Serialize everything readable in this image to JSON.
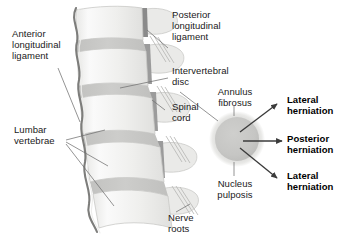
{
  "figure": {
    "background_color": "#ffffff",
    "text_color": "#1a1a1a",
    "bone_light": "#f2f2f0",
    "bone_mid": "#e2e2e0",
    "bone_shade": "#d2d2d0",
    "disc_band": "#c9c9c7",
    "ligament_dark": "#6e6e6e",
    "outline": "#8c8c8c",
    "annulus_color": "#dcdcda",
    "nucleus_color": "#c6c6c4",
    "arrow_color": "#3b3b3b",
    "leader_color": "#6f6f6f"
  },
  "labels": {
    "anterior_longitudinal_ligament": "Anterior\nlongitudinal\nligament",
    "lumbar_vertebrae": "Lumbar\nvertebrae",
    "posterior_longitudinal_ligament": "Posterior\nlongitudinal\nligament",
    "intervertebral_disc": "Intervertebral\ndisc",
    "spinal_cord": "Spinal\ncord",
    "nerve_roots": "Nerve\nroots",
    "annulus_fibrosus": "Annulus\nfibrosus",
    "nucleus_pulposis": "Nucleus\npulposis",
    "lateral_herniation_upper": "Lateral\nherniation",
    "posterior_herniation": "Posterior\nherniation",
    "lateral_herniation_lower": "Lateral\nherniation"
  }
}
